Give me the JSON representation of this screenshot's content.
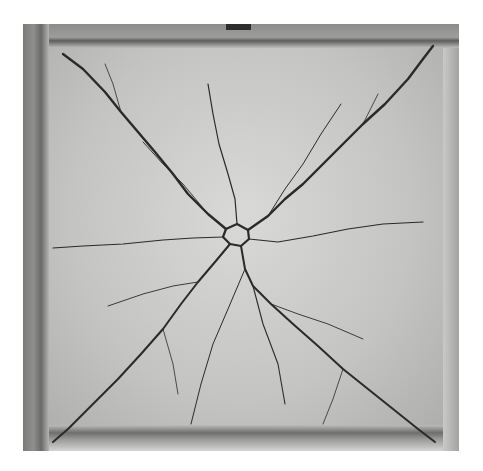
{
  "image": {
    "subject": "cracked concrete slab, top view",
    "style": "grayscale photograph",
    "crack_pattern": "diagonal yield-line cracks radiating from center to the four corners",
    "colors": {
      "background": "#ffffff",
      "slab": "#c4c4c2",
      "frame": "#7a7a78",
      "crack": "#2a2a28"
    }
  }
}
